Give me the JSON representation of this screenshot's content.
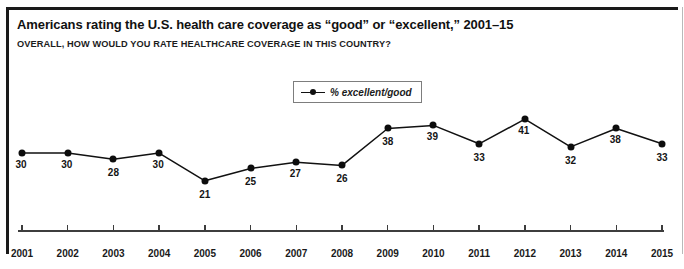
{
  "figure": {
    "title": "Americans rating the U.S. health care coverage as “good” or “excellent,” 2001–15",
    "subtitle": "OVERALL, HOW WOULD YOU RATE HEALTHCARE COVERAGE IN THIS COUNTRY?"
  },
  "legend": {
    "label": "% excellent/good",
    "marker": "line-with-dot-marker",
    "position": "top-center-inside-plot"
  },
  "colors": {
    "series_line": "#111111",
    "marker": "#0d0d0d",
    "axis": "#3d3d3d",
    "frame_rule": "#1a1a1a",
    "background": "#ffffff",
    "text": "#141414"
  },
  "chart_data": {
    "type": "line",
    "title": "Americans rating the U.S. health care coverage as “good” or “excellent,” 2001–15",
    "subtitle": "OVERALL, HOW WOULD YOU RATE HEALTHCARE COVERAGE IN THIS COUNTRY?",
    "xlabel": "",
    "ylabel": "",
    "categories": [
      "2001",
      "2002",
      "2003",
      "2004",
      "2005",
      "2006",
      "2007",
      "2008",
      "2009",
      "2010",
      "2011",
      "2012",
      "2013",
      "2014",
      "2015"
    ],
    "series": [
      {
        "name": "% excellent/good",
        "values": [
          30,
          30,
          28,
          30,
          21,
          25,
          27,
          26,
          38,
          39,
          33,
          41,
          32,
          38,
          33
        ]
      }
    ],
    "point_labels": [
      "30",
      "30",
      "28",
      "30",
      "21",
      "25",
      "27",
      "26",
      "38",
      "39",
      "33",
      "41",
      "32",
      "38",
      "33"
    ],
    "ylim": [
      18,
      44
    ],
    "grid": false,
    "legend_position": "top-center",
    "y_axis_visible": false,
    "x_axis_visible": true
  }
}
